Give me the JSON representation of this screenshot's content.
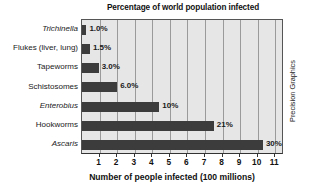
{
  "chart_data": {
    "type": "bar",
    "orientation": "horizontal",
    "title": "Percentage of world population infected",
    "xlabel": "Number of people infected (100 millions)",
    "ylabel": "",
    "xlim": [
      0,
      11.5
    ],
    "xticks": [
      1,
      2,
      3,
      4,
      5,
      6,
      7,
      8,
      9,
      10,
      11
    ],
    "grid": "vertical",
    "legend": "none",
    "categories": [
      "Trichinella",
      "Flukes (liver, lung)",
      "Tapeworms",
      "Schistosomes",
      "Enterobius",
      "Hookworms",
      "Ascaris"
    ],
    "category_styles": [
      "italic",
      "normal",
      "normal",
      "normal",
      "italic",
      "normal",
      "italic"
    ],
    "values": [
      0.25,
      0.45,
      0.95,
      2.0,
      4.4,
      7.5,
      10.3
    ],
    "data_labels": [
      "1.0%",
      "1.5%",
      "3.0%",
      "6.0%",
      "10%",
      "21%",
      "30%"
    ],
    "bar_color": "#3c3c3c",
    "plot_background": "#e6e6e6",
    "gridline_color": "#9a9a9a"
  },
  "credit": "Precision Graphics"
}
